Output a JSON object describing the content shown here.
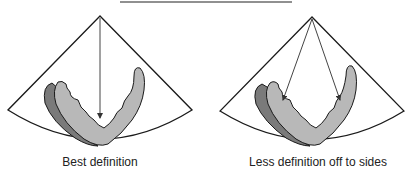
{
  "figure": {
    "panels": [
      {
        "id": "best",
        "caption": "Best definition",
        "beam_count": 1,
        "description": "Central beam aimed straight down at apex of ventricle"
      },
      {
        "id": "sides",
        "caption": "Less definition off to sides",
        "beam_count": 2,
        "description": "Two beams angled toward lateral walls"
      }
    ],
    "colors": {
      "outline": "#1a1a1a",
      "myocardium_light": "#b8b8b8",
      "myocardium_dark": "#7a7a7a",
      "background": "#ffffff"
    }
  }
}
